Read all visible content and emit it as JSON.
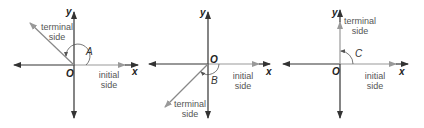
{
  "colors": {
    "axis": "#333333",
    "initial_side": "#999999",
    "terminal_side": "#888888",
    "text": "#555555"
  },
  "diagrams": [
    {
      "id": "angle-A",
      "angle_label": "A",
      "origin_label": "O",
      "x_axis_label": "x",
      "y_axis_label": "y",
      "terminal_label_line1": "terminal",
      "terminal_label_line2": "side",
      "initial_label_line1": "initial",
      "initial_label_line2": "side",
      "terminal_direction": "second quadrant (~135°)"
    },
    {
      "id": "angle-B",
      "angle_label": "B",
      "origin_label": "O",
      "x_axis_label": "x",
      "y_axis_label": "y",
      "terminal_label_line1": "terminal",
      "terminal_label_line2": "side",
      "initial_label_line1": "initial",
      "initial_label_line2": "side",
      "terminal_direction": "third quadrant (~-140°)"
    },
    {
      "id": "angle-C",
      "angle_label": "C",
      "origin_label": "O",
      "x_axis_label": "x",
      "y_axis_label": "y",
      "terminal_label_line1": "terminal",
      "terminal_label_line2": "side",
      "initial_label_line1": "initial",
      "initial_label_line2": "side",
      "terminal_direction": "positive y-axis (90°)"
    }
  ]
}
